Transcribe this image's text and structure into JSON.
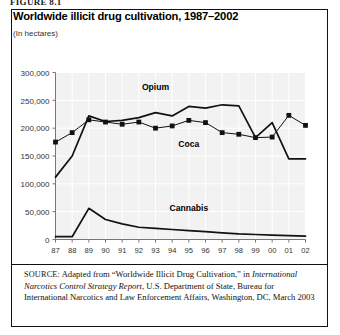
{
  "figure": {
    "label": "FIGURE 8.1"
  },
  "chart": {
    "title": "Worldwide illicit drug cultivation, 1987–2002",
    "subtitle": "(In hectares)"
  },
  "source": {
    "keyword": "SOURCE:",
    "line1": " Adapted from “Worldwide Illicit Drug Cultivation,” in ",
    "italic": "International Narcotics Control Strategy Report",
    "line2": ", U.S. Department of State, Bureau for International Narcotics and Law Enforcement Affairs, Washington, DC, March 2003"
  },
  "chart_data": {
    "type": "line",
    "title": "Worldwide illicit drug cultivation, 1987–2002",
    "subtitle": "(In hectares)",
    "xlabel": "",
    "ylabel": "",
    "ylim": [
      0,
      300000
    ],
    "ytick_labels": [
      "300,000",
      "250,000",
      "200,000",
      "150,000",
      "100,000",
      "50,000",
      "0"
    ],
    "ytick_values": [
      300000,
      250000,
      200000,
      150000,
      100000,
      50000,
      0
    ],
    "grid": true,
    "legend": "inline-annotations",
    "categories": [
      "87",
      "88",
      "89",
      "90",
      "91",
      "92",
      "93",
      "94",
      "95",
      "96",
      "97",
      "98",
      "99",
      "00",
      "01",
      "02"
    ],
    "series": [
      {
        "name": "Opium",
        "markers": false,
        "color": "#111111",
        "values": [
          112000,
          150000,
          222000,
          212000,
          214000,
          219000,
          228000,
          222000,
          239000,
          236000,
          242000,
          240000,
          183000,
          210000,
          145000,
          145000
        ]
      },
      {
        "name": "Coca",
        "markers": true,
        "color": "#111111",
        "values": [
          175000,
          192000,
          215000,
          211000,
          207000,
          211000,
          200000,
          204000,
          214000,
          210000,
          192000,
          189000,
          183000,
          184000,
          223000,
          205000
        ]
      },
      {
        "name": "Cannabis",
        "markers": false,
        "color": "#111111",
        "values": [
          5000,
          5000,
          56000,
          36000,
          28000,
          22000,
          20000,
          18000,
          16000,
          14000,
          12000,
          10000,
          9000,
          8000,
          7000,
          6000
        ]
      }
    ],
    "annotations": [
      {
        "text": "Opium",
        "x": "93",
        "y": 268000
      },
      {
        "text": "Coca",
        "x": "95",
        "y": 166000
      },
      {
        "text": "Cannabis",
        "x": "95",
        "y": 52000
      }
    ]
  }
}
